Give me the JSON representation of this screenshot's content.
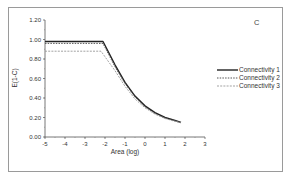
{
  "chart_data": {
    "type": "line",
    "title": "",
    "panel_label": "C",
    "xlabel": "Area (log)",
    "ylabel": "E(1-C)",
    "xlim": [
      -5,
      3
    ],
    "ylim": [
      0,
      1.2
    ],
    "x_ticks": [
      "-5",
      "-4",
      "-3",
      "-2",
      "-1",
      "0",
      "1",
      "2",
      "3"
    ],
    "y_ticks": [
      "0.00",
      "0.20",
      "0.40",
      "0.60",
      "0.80",
      "1.00",
      "1.20"
    ],
    "grid": false,
    "legend_position": "right",
    "series": [
      {
        "name": "Connectivity 1",
        "style": "solid",
        "color": "#222222",
        "x": [
          -5,
          -2.1,
          -1.5,
          -1,
          -0.5,
          0,
          0.5,
          1,
          1.5,
          1.8
        ],
        "y": [
          0.98,
          0.98,
          0.74,
          0.56,
          0.42,
          0.32,
          0.25,
          0.2,
          0.17,
          0.15
        ]
      },
      {
        "name": "Connectivity 2",
        "style": "dotted",
        "color": "#555555",
        "x": [
          -5,
          -2.1,
          -1.5,
          -1,
          -0.5,
          0,
          0.5,
          1,
          1.5,
          1.8
        ],
        "y": [
          0.96,
          0.96,
          0.72,
          0.55,
          0.41,
          0.31,
          0.24,
          0.195,
          0.165,
          0.148
        ]
      },
      {
        "name": "Connectivity 3",
        "style": "dashed-light",
        "color": "#999999",
        "x": [
          -5,
          -2.2,
          -1.5,
          -1,
          -0.5,
          0,
          0.5,
          1,
          1.5,
          1.8
        ],
        "y": [
          0.88,
          0.88,
          0.68,
          0.52,
          0.39,
          0.3,
          0.235,
          0.19,
          0.16,
          0.145
        ]
      }
    ]
  }
}
